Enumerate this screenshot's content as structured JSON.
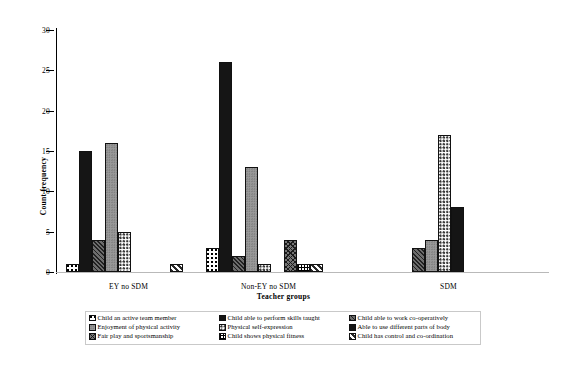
{
  "chart_data": {
    "type": "bar",
    "title": "",
    "xlabel": "Teacher groups",
    "ylabel": "Count frequency",
    "ylim": [
      0,
      30
    ],
    "ytick_labels": [
      "0",
      "5",
      "10",
      "15",
      "20",
      "25",
      "30"
    ],
    "ytick_values": [
      0,
      5,
      10,
      15,
      20,
      25,
      30
    ],
    "grid": false,
    "legend_position": "bottom",
    "categories": [
      "EY no SDM",
      "Non-EY no SDM",
      "SDM"
    ],
    "series": [
      {
        "name": "Child an active team member",
        "pattern": "checkerdot",
        "values": [
          1,
          3,
          0
        ]
      },
      {
        "name": "Child able to perform skills taught",
        "pattern": "solidblack",
        "values": [
          15,
          26,
          0
        ]
      },
      {
        "name": "Child able to work co-operatively",
        "pattern": "diaghatch",
        "values": [
          4,
          2,
          3
        ]
      },
      {
        "name": "Enjoyment of physical activity",
        "pattern": "gray",
        "values": [
          16,
          13,
          4
        ]
      },
      {
        "name": "Physical self-expression",
        "pattern": "dots",
        "values": [
          5,
          1,
          17
        ]
      },
      {
        "name": "Able to use different parts of body",
        "pattern": "solidblack2",
        "values": [
          0,
          0,
          8
        ]
      },
      {
        "name": "Fair play and sportsmanship",
        "pattern": "crosshatch",
        "values": [
          0,
          4,
          0
        ]
      },
      {
        "name": "Child shows physical fitness",
        "pattern": "grid",
        "values": [
          0,
          1,
          0
        ]
      },
      {
        "name": "Child has control and co-ordination",
        "pattern": "diagstripe",
        "values": [
          1,
          1,
          0
        ]
      }
    ],
    "legend_columns": [
      [
        "Child an active team member",
        "Enjoyment of physical activity",
        "Fair play and sportsmanship"
      ],
      [
        "Child able to perform skills taught",
        "Physical self-expression",
        "Child shows physical fitness"
      ],
      [
        "Child able to work co-operatively",
        "Able to use different parts of body",
        "Child has control and co-ordination"
      ]
    ]
  },
  "axes": {
    "y_title": "Count frequency",
    "x_title": "Teacher groups",
    "y_ticks": [
      "30",
      "25",
      "20",
      "15",
      "10",
      "5",
      "0"
    ],
    "x_groups": [
      "EY no SDM",
      "Non-EY no SDM",
      "SDM"
    ]
  },
  "legend": {
    "items": [
      {
        "label": "Child an active team member",
        "swatch": "checkerdot-swatch"
      },
      {
        "label": "Child able to perform skills taught",
        "swatch": "solidblack-swatch"
      },
      {
        "label": "Child able to work co-operatively",
        "swatch": "diaghatch-swatch"
      },
      {
        "label": "Enjoyment of physical activity",
        "swatch": "gray-swatch"
      },
      {
        "label": "Physical self-expression",
        "swatch": "dots-swatch"
      },
      {
        "label": "Able to use different parts of body",
        "swatch": "solidblack2-swatch"
      },
      {
        "label": "Fair play and sportsmanship",
        "swatch": "crosshatch-swatch"
      },
      {
        "label": "Child shows physical fitness",
        "swatch": "grid-swatch"
      },
      {
        "label": "Child has control and co-ordination",
        "swatch": "diagstripe-swatch"
      }
    ]
  },
  "colors": {
    "ink": "#151515",
    "gray_fill": "#9a9a9a",
    "hatch_fill": "#6d6d6d",
    "axis": "#000000",
    "background": "#ffffff"
  }
}
